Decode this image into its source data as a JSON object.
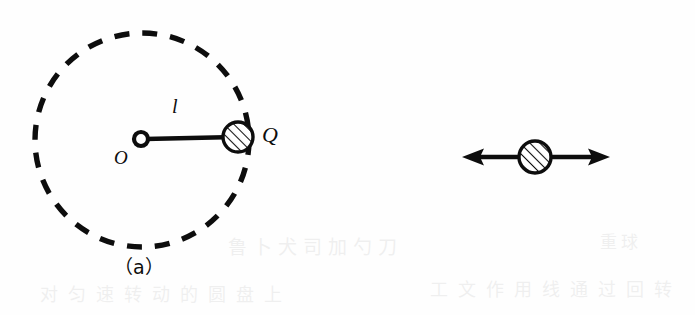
{
  "figure": {
    "type": "physics-diagram",
    "background_color": "#fefefe",
    "ink_color": "#0d0d0d",
    "panels": [
      {
        "id": "a",
        "caption": "（a）",
        "description": "Rotating arm of length l pivoting at O with mass Q travelling on a dashed circular path",
        "elements": {
          "hub_label": "O",
          "arm_label": "l",
          "mass_label": "Q",
          "path_style": "dashed-circle",
          "mass_style": "hatched-circle"
        },
        "geometry": {
          "circle_center_x": 142,
          "circle_center_y": 140,
          "circle_radius": 107,
          "hub_x": 141,
          "hub_y": 139,
          "hub_radius": 7,
          "mass_x": 238,
          "mass_y": 137,
          "mass_radius": 15
        }
      },
      {
        "id": "b",
        "caption": "（b）",
        "description": "Free body diagram of the mass with reaction force to the left and centrifugal force to the right",
        "elements": {
          "left_force_label": "N",
          "left_force_subscript": "d",
          "right_force_numerator": "Q",
          "right_force_denominator": "g",
          "right_force_length": "l",
          "right_force_omega": "ω",
          "right_force_exponent": "2",
          "mass_style": "hatched-circle"
        },
        "geometry": {
          "mass_x": 535,
          "mass_y": 157,
          "mass_radius": 16,
          "left_arrow_tip_x": 462,
          "right_arrow_tip_x": 610,
          "axis_y": 157
        }
      }
    ]
  },
  "ghost_text": {
    "line_a": "鲁卜犬司加勺刀",
    "line_b": "对匀速转动的圆盘上",
    "line_c": "工文作用线通过回转",
    "line_d": "重球"
  }
}
